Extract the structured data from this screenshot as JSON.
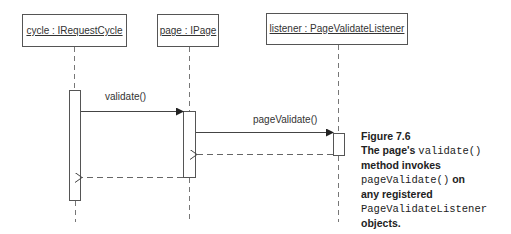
{
  "diagram": {
    "type": "uml-sequence",
    "objects": [
      {
        "id": "cycle",
        "label": "cycle : IRequestCycle"
      },
      {
        "id": "page",
        "label": "page : IPage"
      },
      {
        "id": "listener",
        "label": "listener : PageValidateListener"
      }
    ],
    "messages": [
      {
        "from": "cycle",
        "to": "page",
        "label": "validate()",
        "kind": "call"
      },
      {
        "from": "page",
        "to": "listener",
        "label": "pageValidate()",
        "kind": "call"
      },
      {
        "from": "listener",
        "to": "page",
        "label": "",
        "kind": "return"
      },
      {
        "from": "page",
        "to": "cycle",
        "label": "",
        "kind": "return"
      }
    ]
  },
  "caption": {
    "figure": "Figure 7.6",
    "line1_a": "The page's ",
    "line1_code": "validate()",
    "line2": "method invokes",
    "line3_code": "pageValidate()",
    "line3_b": " on",
    "line4": "any registered",
    "line5_code": "PageValidateListener",
    "line6": "objects."
  }
}
